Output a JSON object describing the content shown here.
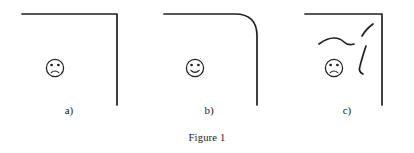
{
  "figure": {
    "caption": "Figure 1",
    "stroke_color": "#1f1f1f",
    "background_color": "#ffffff"
  },
  "panels": [
    {
      "id": "a",
      "label": "a)",
      "corner_type": "sharp",
      "corner_radius": 0,
      "face": "frowning-face",
      "face_mood": "sad",
      "squiggles": 0
    },
    {
      "id": "b",
      "label": "b)",
      "corner_type": "rounded",
      "corner_radius": 22,
      "face": "smiling-face",
      "face_mood": "happy",
      "squiggles": 0
    },
    {
      "id": "c",
      "label": "c)",
      "corner_type": "sharp",
      "corner_radius": 0,
      "face": "frowning-face",
      "face_mood": "sad",
      "squiggles": 3
    }
  ]
}
